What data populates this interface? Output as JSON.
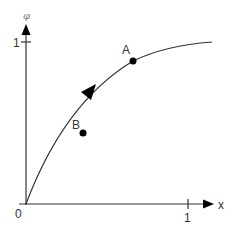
{
  "diagram": {
    "axes": {
      "y_label": "φ",
      "x_label": "x",
      "origin_label": "0",
      "y_tick_label": "1",
      "x_tick_label": "1"
    },
    "points": [
      {
        "label": "A",
        "description": "point on curve, upper"
      },
      {
        "label": "B",
        "description": "point on curve, lower"
      }
    ],
    "curve": {
      "description": "concave increasing curve from origin toward phi=1, with direction arrow pointing from B toward A"
    },
    "colors": {
      "line": "#333333",
      "point": "#000000",
      "label": "#333333",
      "axis_label_phi": "#777777"
    }
  }
}
